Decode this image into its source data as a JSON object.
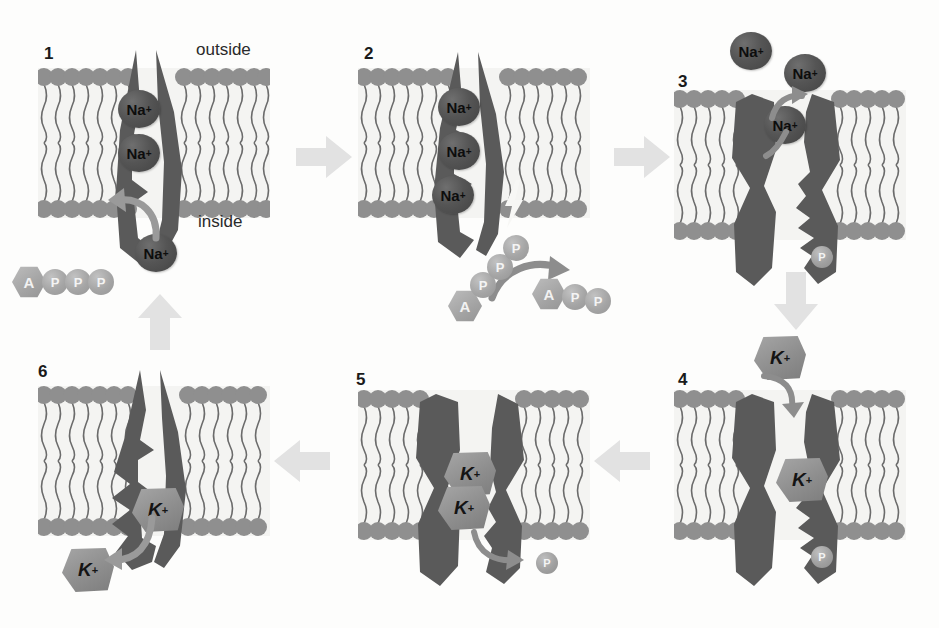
{
  "figure": {
    "type": "diagram",
    "steps_count": 6,
    "colors": {
      "background": "#fdfdfc",
      "protein": "#5a5a5a",
      "membrane_head": "#8f8f8f",
      "membrane_tail": "#6b6b6b",
      "membrane_core": "#f4f4f2",
      "sodium_ion": "#4f4f4f",
      "potassium_ion": "#949494",
      "nucleotide": "#a5a5a5",
      "step_arrow": "#e2e2e2",
      "curved_arrow": "#9a9a9a",
      "text": "#1a1a1a"
    }
  },
  "labels": {
    "outside": "outside",
    "inside": "inside",
    "sodium": "Na",
    "sodium_charge": "+",
    "potassium": "K",
    "potassium_charge": "+",
    "adenosine": "A",
    "phosphate": "P"
  },
  "panels": [
    {
      "number": "1",
      "caption_outside": "outside",
      "caption_inside": "inside",
      "sodium_ions": [
        "Na",
        "Na",
        "Na"
      ],
      "sodium_bound_count": 2,
      "sodium_entering_count": 1,
      "nucleotide": "ATP",
      "nucleotide_units": [
        "A",
        "P",
        "P",
        "P"
      ],
      "potassium_ions": [],
      "phosphate_attached": false,
      "lightning": false
    },
    {
      "number": "2",
      "sodium_ions": [
        "Na",
        "Na",
        "Na"
      ],
      "sodium_bound_count": 3,
      "sodium_entering_count": 0,
      "nucleotide": "ATP",
      "nucleotide_units": [
        "A",
        "P",
        "P",
        "P"
      ],
      "released_nucleotide": "ADP",
      "released_units": [
        "A",
        "P",
        "P"
      ],
      "potassium_ions": [],
      "phosphate_attached": false,
      "lightning": true
    },
    {
      "number": "3",
      "sodium_ions": [
        "Na",
        "Na",
        "Na"
      ],
      "sodium_bound_count": 0,
      "sodium_released_count": 3,
      "nucleotide": null,
      "potassium_ions": [],
      "phosphate_attached": true,
      "phosphate_label": "P",
      "lightning": false
    },
    {
      "number": "4",
      "sodium_ions": [],
      "potassium_ions": [
        "K",
        "K"
      ],
      "potassium_binding_count": 2,
      "phosphate_attached": true,
      "phosphate_label": "P",
      "lightning": false
    },
    {
      "number": "5",
      "sodium_ions": [],
      "potassium_ions": [
        "K",
        "K"
      ],
      "potassium_bound_count": 2,
      "phosphate_attached": false,
      "phosphate_released": true,
      "phosphate_label": "P",
      "lightning": false
    },
    {
      "number": "6",
      "sodium_ions": [],
      "potassium_ions": [
        "K",
        "K"
      ],
      "potassium_releasing_count": 2,
      "phosphate_attached": false,
      "lightning": false
    }
  ],
  "flow_arrows": [
    {
      "name": "arrow-1-to-2",
      "direction": "right"
    },
    {
      "name": "arrow-2-to-3",
      "direction": "right"
    },
    {
      "name": "arrow-3-to-4",
      "direction": "down"
    },
    {
      "name": "arrow-4-to-5",
      "direction": "left"
    },
    {
      "name": "arrow-5-to-6",
      "direction": "left"
    },
    {
      "name": "arrow-6-to-1",
      "direction": "up"
    }
  ]
}
